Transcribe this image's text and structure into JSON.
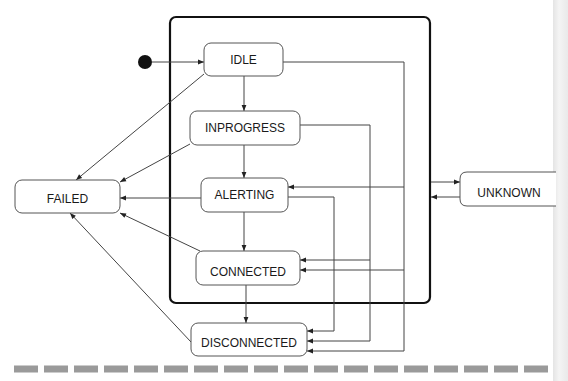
{
  "diagram": {
    "type": "state-machine",
    "composite_state": {
      "label": ""
    },
    "initial_state": {
      "target": "IDLE"
    },
    "states": [
      {
        "id": "idle",
        "label": "IDLE"
      },
      {
        "id": "inprogress",
        "label": "INPROGRESS"
      },
      {
        "id": "alerting",
        "label": "ALERTING"
      },
      {
        "id": "connected",
        "label": "CONNECTED"
      },
      {
        "id": "disconnected",
        "label": "DISCONNECTED"
      },
      {
        "id": "failed",
        "label": "FAILED"
      },
      {
        "id": "unknown",
        "label": "UNKNOWN"
      }
    ],
    "transitions": [
      {
        "from": "initial",
        "to": "IDLE"
      },
      {
        "from": "IDLE",
        "to": "INPROGRESS"
      },
      {
        "from": "INPROGRESS",
        "to": "ALERTING"
      },
      {
        "from": "ALERTING",
        "to": "CONNECTED"
      },
      {
        "from": "CONNECTED",
        "to": "DISCONNECTED"
      },
      {
        "from": "IDLE",
        "to": "FAILED"
      },
      {
        "from": "INPROGRESS",
        "to": "FAILED"
      },
      {
        "from": "ALERTING",
        "to": "FAILED"
      },
      {
        "from": "CONNECTED",
        "to": "FAILED"
      },
      {
        "from": "DISCONNECTED",
        "to": "FAILED"
      },
      {
        "from": "IDLE",
        "to": "ALERTING"
      },
      {
        "from": "IDLE",
        "to": "CONNECTED"
      },
      {
        "from": "IDLE",
        "to": "DISCONNECTED"
      },
      {
        "from": "INPROGRESS",
        "to": "CONNECTED"
      },
      {
        "from": "INPROGRESS",
        "to": "DISCONNECTED"
      },
      {
        "from": "ALERTING",
        "to": "DISCONNECTED"
      },
      {
        "from": "composite",
        "to": "UNKNOWN"
      },
      {
        "from": "UNKNOWN",
        "to": "composite"
      }
    ]
  },
  "colors": {
    "line": "#444444",
    "box_border": "#555555",
    "composite_border": "#111111",
    "initial_dot": "#111111",
    "dash": "#9a9a9a"
  }
}
